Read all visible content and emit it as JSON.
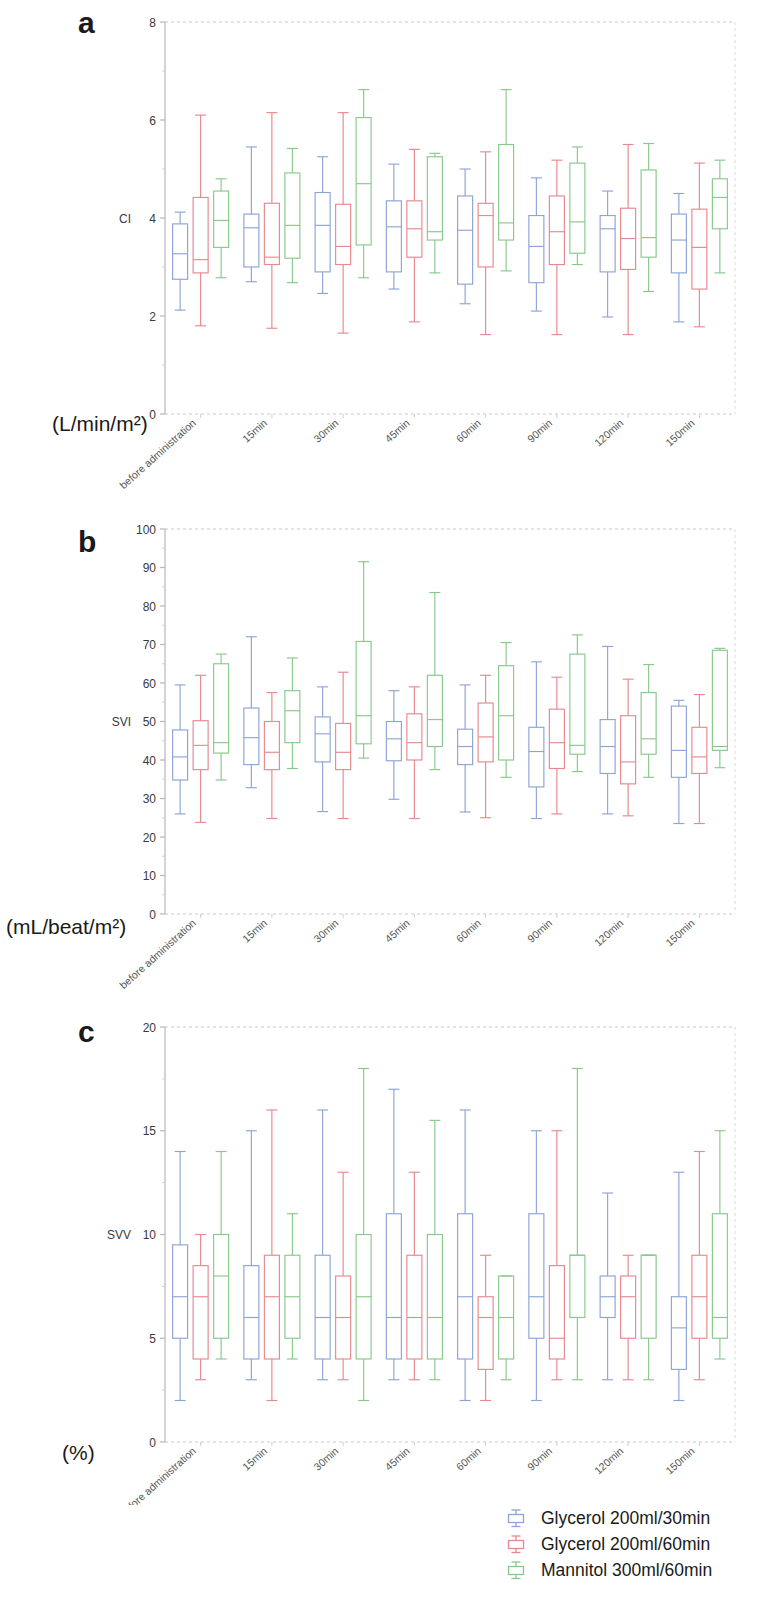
{
  "figure": {
    "panels": [
      {
        "letter": "a",
        "y_axis_title": "CI",
        "unit": "(L/min/m²)"
      },
      {
        "letter": "b",
        "y_axis_title": "SVI",
        "unit": "(mL/beat/m²)"
      },
      {
        "letter": "c",
        "y_axis_title": "SVV",
        "unit": "(%)"
      }
    ]
  },
  "legend": {
    "position": "bottom-right",
    "items": [
      {
        "label": "Glycerol 200ml/30min",
        "color": "#8da4d6"
      },
      {
        "label": "Glycerol 200ml/60min",
        "color": "#e8888f"
      },
      {
        "label": "Mannitol 300ml/60min",
        "color": "#88c98a"
      }
    ]
  },
  "colors": {
    "glycerol_30": "#8da4d6",
    "glycerol_60": "#e8888f",
    "mannitol_60": "#88c98a",
    "axis": "#b8b8b8",
    "text": "#3a3a3a"
  },
  "chart_data": [
    {
      "type": "box",
      "panel": "a",
      "title": "CI",
      "ylabel": "CI",
      "yunit": "(L/min/m²)",
      "xlabel": "",
      "ylim": [
        0,
        8
      ],
      "yticks": [
        0,
        2,
        4,
        6,
        8
      ],
      "grid": false,
      "categories": [
        "before administration",
        "15min",
        "30min",
        "45min",
        "60min",
        "90min",
        "120min",
        "150min"
      ],
      "legend": [
        "Glycerol 200ml/30min",
        "Glycerol 200ml/60min",
        "Mannitol 300ml/60min"
      ],
      "series": [
        {
          "name": "Glycerol 200ml/30min",
          "color": "#8da4d6",
          "boxes": [
            {
              "min": 2.12,
              "q1": 2.75,
              "median": 3.27,
              "q3": 3.88,
              "max": 4.12
            },
            {
              "min": 2.7,
              "q1": 3.0,
              "median": 3.8,
              "q3": 4.08,
              "max": 5.45
            },
            {
              "min": 2.46,
              "q1": 2.9,
              "median": 3.85,
              "q3": 4.52,
              "max": 5.25
            },
            {
              "min": 2.55,
              "q1": 2.9,
              "median": 3.82,
              "q3": 4.35,
              "max": 5.1
            },
            {
              "min": 2.25,
              "q1": 2.65,
              "median": 3.75,
              "q3": 4.45,
              "max": 5.0
            },
            {
              "min": 2.1,
              "q1": 2.68,
              "median": 3.42,
              "q3": 4.05,
              "max": 4.82
            },
            {
              "min": 1.98,
              "q1": 2.9,
              "median": 3.78,
              "q3": 4.05,
              "max": 4.55
            },
            {
              "min": 1.88,
              "q1": 2.88,
              "median": 3.55,
              "q3": 4.08,
              "max": 4.5
            }
          ]
        },
        {
          "name": "Glycerol 200ml/60min",
          "color": "#e8888f",
          "boxes": [
            {
              "min": 1.8,
              "q1": 2.88,
              "median": 3.15,
              "q3": 4.42,
              "max": 6.1
            },
            {
              "min": 1.75,
              "q1": 3.05,
              "median": 3.2,
              "q3": 4.3,
              "max": 6.15
            },
            {
              "min": 1.65,
              "q1": 3.05,
              "median": 3.42,
              "q3": 4.28,
              "max": 6.15
            },
            {
              "min": 1.88,
              "q1": 3.2,
              "median": 3.78,
              "q3": 4.35,
              "max": 5.4
            },
            {
              "min": 1.62,
              "q1": 3.0,
              "median": 4.05,
              "q3": 4.3,
              "max": 5.35
            },
            {
              "min": 1.62,
              "q1": 3.05,
              "median": 3.72,
              "q3": 4.45,
              "max": 5.18
            },
            {
              "min": 1.62,
              "q1": 2.95,
              "median": 3.58,
              "q3": 4.2,
              "max": 5.5
            },
            {
              "min": 1.78,
              "q1": 2.55,
              "median": 3.4,
              "q3": 4.18,
              "max": 5.12
            }
          ]
        },
        {
          "name": "Mannitol 300ml/60min",
          "color": "#88c98a",
          "boxes": [
            {
              "min": 2.78,
              "q1": 3.4,
              "median": 3.95,
              "q3": 4.55,
              "max": 4.8
            },
            {
              "min": 2.68,
              "q1": 3.18,
              "median": 3.85,
              "q3": 4.92,
              "max": 5.42
            },
            {
              "min": 2.78,
              "q1": 3.45,
              "median": 4.7,
              "q3": 6.05,
              "max": 6.62
            },
            {
              "min": 2.88,
              "q1": 3.55,
              "median": 3.72,
              "q3": 5.25,
              "max": 5.32
            },
            {
              "min": 2.92,
              "q1": 3.55,
              "median": 3.9,
              "q3": 5.5,
              "max": 6.62
            },
            {
              "min": 3.05,
              "q1": 3.28,
              "median": 3.92,
              "q3": 5.12,
              "max": 5.45
            },
            {
              "min": 2.5,
              "q1": 3.2,
              "median": 3.6,
              "q3": 4.98,
              "max": 5.52
            },
            {
              "min": 2.88,
              "q1": 3.78,
              "median": 4.42,
              "q3": 4.8,
              "max": 5.18
            }
          ]
        }
      ]
    },
    {
      "type": "box",
      "panel": "b",
      "title": "SVI",
      "ylabel": "SVI",
      "yunit": "(mL/beat/m²)",
      "xlabel": "",
      "ylim": [
        0,
        100
      ],
      "yticks": [
        0,
        10,
        20,
        30,
        40,
        50,
        60,
        70,
        80,
        90,
        100
      ],
      "grid": false,
      "categories": [
        "before administration",
        "15min",
        "30min",
        "45min",
        "60min",
        "90min",
        "120min",
        "150min"
      ],
      "legend": [
        "Glycerol 200ml/30min",
        "Glycerol 200ml/60min",
        "Mannitol 300ml/60min"
      ],
      "series": [
        {
          "name": "Glycerol 200ml/30min",
          "color": "#8da4d6",
          "boxes": [
            {
              "min": 26.0,
              "q1": 34.8,
              "median": 40.8,
              "q3": 47.8,
              "max": 59.5
            },
            {
              "min": 32.8,
              "q1": 38.8,
              "median": 45.8,
              "q3": 53.5,
              "max": 72.0
            },
            {
              "min": 26.6,
              "q1": 39.5,
              "median": 46.8,
              "q3": 51.2,
              "max": 59.0
            },
            {
              "min": 29.8,
              "q1": 39.8,
              "median": 45.5,
              "q3": 50.0,
              "max": 58.0
            },
            {
              "min": 26.5,
              "q1": 38.8,
              "median": 43.5,
              "q3": 48.0,
              "max": 59.5
            },
            {
              "min": 24.8,
              "q1": 33.0,
              "median": 42.2,
              "q3": 48.5,
              "max": 65.5
            },
            {
              "min": 26.0,
              "q1": 36.5,
              "median": 43.5,
              "q3": 50.5,
              "max": 69.5
            },
            {
              "min": 23.5,
              "q1": 35.5,
              "median": 42.5,
              "q3": 54.0,
              "max": 55.5
            }
          ]
        },
        {
          "name": "Glycerol 200ml/60min",
          "color": "#e8888f",
          "boxes": [
            {
              "min": 23.8,
              "q1": 37.5,
              "median": 43.8,
              "q3": 50.2,
              "max": 62.0
            },
            {
              "min": 24.8,
              "q1": 37.5,
              "median": 42.0,
              "q3": 50.0,
              "max": 57.5
            },
            {
              "min": 24.8,
              "q1": 37.5,
              "median": 42.0,
              "q3": 49.5,
              "max": 62.8
            },
            {
              "min": 24.8,
              "q1": 40.0,
              "median": 44.5,
              "q3": 52.0,
              "max": 59.0
            },
            {
              "min": 25.0,
              "q1": 39.5,
              "median": 46.0,
              "q3": 54.8,
              "max": 62.0
            },
            {
              "min": 26.0,
              "q1": 37.8,
              "median": 44.5,
              "q3": 53.2,
              "max": 61.5
            },
            {
              "min": 25.5,
              "q1": 33.8,
              "median": 39.5,
              "q3": 51.5,
              "max": 61.0
            },
            {
              "min": 23.5,
              "q1": 36.5,
              "median": 40.8,
              "q3": 48.5,
              "max": 57.0
            }
          ]
        },
        {
          "name": "Mannitol 300ml/60min",
          "color": "#88c98a",
          "boxes": [
            {
              "min": 34.8,
              "q1": 41.8,
              "median": 44.5,
              "q3": 65.0,
              "max": 67.5
            },
            {
              "min": 37.8,
              "q1": 44.5,
              "median": 52.8,
              "q3": 58.0,
              "max": 66.5
            },
            {
              "min": 40.5,
              "q1": 44.2,
              "median": 51.5,
              "q3": 70.8,
              "max": 91.5
            },
            {
              "min": 37.5,
              "q1": 43.5,
              "median": 50.5,
              "q3": 62.0,
              "max": 83.5
            },
            {
              "min": 35.5,
              "q1": 40.0,
              "median": 51.5,
              "q3": 64.5,
              "max": 70.5
            },
            {
              "min": 37.0,
              "q1": 41.5,
              "median": 43.8,
              "q3": 67.5,
              "max": 72.5
            },
            {
              "min": 35.5,
              "q1": 41.5,
              "median": 45.5,
              "q3": 57.5,
              "max": 64.8
            },
            {
              "min": 38.0,
              "q1": 42.5,
              "median": 43.5,
              "q3": 68.5,
              "max": 69.0
            }
          ]
        }
      ]
    },
    {
      "type": "box",
      "panel": "c",
      "title": "SVV",
      "ylabel": "SVV",
      "yunit": "(%)",
      "xlabel": "",
      "ylim": [
        0,
        20
      ],
      "yticks": [
        0,
        5,
        10,
        15,
        20
      ],
      "grid": false,
      "categories": [
        "before administration",
        "15min",
        "30min",
        "45min",
        "60min",
        "90min",
        "120min",
        "150min"
      ],
      "legend": [
        "Glycerol 200ml/30min",
        "Glycerol 200ml/60min",
        "Mannitol 300ml/60min"
      ],
      "series": [
        {
          "name": "Glycerol 200ml/30min",
          "color": "#8da4d6",
          "boxes": [
            {
              "min": 2.0,
              "q1": 5.0,
              "median": 7.0,
              "q3": 9.5,
              "max": 14.0
            },
            {
              "min": 3.0,
              "q1": 4.0,
              "median": 6.0,
              "q3": 8.5,
              "max": 15.0
            },
            {
              "min": 3.0,
              "q1": 4.0,
              "median": 6.0,
              "q3": 9.0,
              "max": 16.0
            },
            {
              "min": 3.0,
              "q1": 4.0,
              "median": 6.0,
              "q3": 11.0,
              "max": 17.0
            },
            {
              "min": 2.0,
              "q1": 4.0,
              "median": 7.0,
              "q3": 11.0,
              "max": 16.0
            },
            {
              "min": 2.0,
              "q1": 5.0,
              "median": 7.0,
              "q3": 11.0,
              "max": 15.0
            },
            {
              "min": 3.0,
              "q1": 6.0,
              "median": 7.0,
              "q3": 8.0,
              "max": 12.0
            },
            {
              "min": 2.0,
              "q1": 3.5,
              "median": 5.5,
              "q3": 7.0,
              "max": 13.0
            }
          ]
        },
        {
          "name": "Glycerol 200ml/60min",
          "color": "#e8888f",
          "boxes": [
            {
              "min": 3.0,
              "q1": 4.0,
              "median": 7.0,
              "q3": 8.5,
              "max": 10.0
            },
            {
              "min": 2.0,
              "q1": 4.0,
              "median": 7.0,
              "q3": 9.0,
              "max": 16.0
            },
            {
              "min": 3.0,
              "q1": 4.0,
              "median": 6.0,
              "q3": 8.0,
              "max": 13.0
            },
            {
              "min": 3.0,
              "q1": 4.0,
              "median": 6.0,
              "q3": 9.0,
              "max": 13.0
            },
            {
              "min": 2.0,
              "q1": 3.5,
              "median": 6.0,
              "q3": 7.0,
              "max": 9.0
            },
            {
              "min": 3.0,
              "q1": 4.0,
              "median": 5.0,
              "q3": 8.5,
              "max": 15.0
            },
            {
              "min": 3.0,
              "q1": 5.0,
              "median": 7.0,
              "q3": 8.0,
              "max": 9.0
            },
            {
              "min": 3.0,
              "q1": 5.0,
              "median": 7.0,
              "q3": 9.0,
              "max": 14.0
            }
          ]
        },
        {
          "name": "Mannitol 300ml/60min",
          "color": "#88c98a",
          "boxes": [
            {
              "min": 4.0,
              "q1": 5.0,
              "median": 8.0,
              "q3": 10.0,
              "max": 14.0
            },
            {
              "min": 4.0,
              "q1": 5.0,
              "median": 7.0,
              "q3": 9.0,
              "max": 11.0
            },
            {
              "min": 2.0,
              "q1": 4.0,
              "median": 7.0,
              "q3": 10.0,
              "max": 18.0
            },
            {
              "min": 3.0,
              "q1": 4.0,
              "median": 6.0,
              "q3": 10.0,
              "max": 15.5
            },
            {
              "min": 3.0,
              "q1": 4.0,
              "median": 6.0,
              "q3": 8.0,
              "max": 8.0
            },
            {
              "min": 3.0,
              "q1": 6.0,
              "median": 9.0,
              "q3": 9.0,
              "max": 18.0
            },
            {
              "min": 3.0,
              "q1": 5.0,
              "median": 9.0,
              "q3": 9.0,
              "max": 9.0
            },
            {
              "min": 4.0,
              "q1": 5.0,
              "median": 6.0,
              "q3": 11.0,
              "max": 15.0
            }
          ]
        }
      ]
    }
  ]
}
